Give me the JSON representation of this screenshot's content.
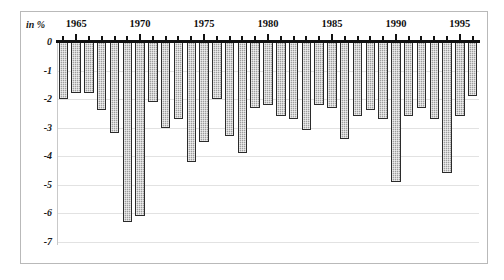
{
  "chart_data": {
    "type": "bar",
    "title": "",
    "subtitle": "",
    "xlabel": "",
    "ylabel": "in %",
    "unit_label": "in %",
    "ylim": [
      -7,
      0
    ],
    "ytick_labels": [
      "0",
      "-1",
      "-2",
      "-3",
      "-4",
      "-5",
      "-6",
      "-7"
    ],
    "ytick_values": [
      0,
      -1,
      -2,
      -3,
      -4,
      -5,
      -6,
      -7
    ],
    "xtick_labels": [
      "1965",
      "1970",
      "1975",
      "1980",
      "1985",
      "1990",
      "1995"
    ],
    "xtick_values": [
      1965,
      1970,
      1975,
      1980,
      1985,
      1990,
      1995
    ],
    "grid": true,
    "legend": "none",
    "orientation": "vertical",
    "bar_fill_color": "#b4b4b4",
    "bar_border_color": "#2b2b2b",
    "axis_color": "#111111",
    "gridline_color": "#e2e2e2",
    "frame_color": "#b9b9b9",
    "categories": [
      1964,
      1965,
      1966,
      1967,
      1968,
      1969,
      1970,
      1971,
      1972,
      1973,
      1974,
      1975,
      1976,
      1977,
      1978,
      1979,
      1980,
      1981,
      1982,
      1983,
      1984,
      1985,
      1986,
      1987,
      1988,
      1989,
      1990,
      1991,
      1992,
      1993,
      1994,
      1995,
      1996
    ],
    "values": [
      -2.0,
      -1.8,
      -1.8,
      -2.4,
      -3.2,
      -6.3,
      -6.1,
      -2.1,
      -3.0,
      -2.7,
      -4.2,
      -3.5,
      -2.0,
      -3.3,
      -3.9,
      -2.3,
      -2.2,
      -2.6,
      -2.7,
      -3.1,
      -2.2,
      -2.3,
      -3.4,
      -2.6,
      -2.4,
      -2.7,
      -4.9,
      -2.6,
      -2.3,
      -2.7,
      -4.6,
      -2.6,
      -1.9
    ]
  }
}
